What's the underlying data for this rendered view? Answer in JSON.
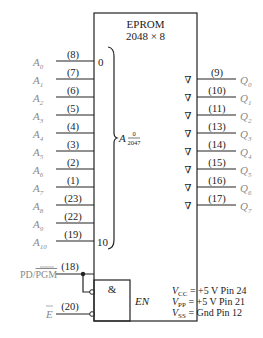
{
  "chip": {
    "title_line1": "EPROM",
    "title_line2": "2048 × 8",
    "address_range_start": "0",
    "address_range_end": "10",
    "address_label": "A",
    "address_num": "0",
    "address_den": "2047"
  },
  "address_inputs": [
    {
      "signal": "A",
      "sub": "0",
      "pin": "(8)"
    },
    {
      "signal": "A",
      "sub": "1",
      "pin": "(7)"
    },
    {
      "signal": "A",
      "sub": "2",
      "pin": "(6)"
    },
    {
      "signal": "A",
      "sub": "3",
      "pin": "(5)"
    },
    {
      "signal": "A",
      "sub": "4",
      "pin": "(4)"
    },
    {
      "signal": "A",
      "sub": "5",
      "pin": "(3)"
    },
    {
      "signal": "A",
      "sub": "6",
      "pin": "(2)"
    },
    {
      "signal": "A",
      "sub": "7",
      "pin": "(1)"
    },
    {
      "signal": "A",
      "sub": "8",
      "pin": "(23)"
    },
    {
      "signal": "A",
      "sub": "9",
      "pin": "(22)"
    },
    {
      "signal": "A",
      "sub": "10",
      "pin": "(19)"
    }
  ],
  "data_outputs": [
    {
      "signal": "Q",
      "sub": "0",
      "pin": "(9)",
      "symbol": "∇"
    },
    {
      "signal": "Q",
      "sub": "1",
      "pin": "(10)",
      "symbol": "∇"
    },
    {
      "signal": "Q",
      "sub": "2",
      "pin": "(11)",
      "symbol": "∇"
    },
    {
      "signal": "Q",
      "sub": "3",
      "pin": "(13)",
      "symbol": "∇"
    },
    {
      "signal": "Q",
      "sub": "4",
      "pin": "(14)",
      "symbol": "∇"
    },
    {
      "signal": "Q",
      "sub": "5",
      "pin": "(15)",
      "symbol": "∇"
    },
    {
      "signal": "Q",
      "sub": "6",
      "pin": "(16)",
      "symbol": "∇"
    },
    {
      "signal": "Q",
      "sub": "7",
      "pin": "(17)",
      "symbol": "∇"
    }
  ],
  "control": {
    "pd_pgm_label_pd": "PD/",
    "pd_pgm_label_pgm": "PGM",
    "pd_pgm_pin": "(18)",
    "e_label": "E",
    "e_pin": "(20)",
    "and_symbol": "&",
    "enable_label": "EN"
  },
  "power": [
    {
      "v": "V",
      "sub": "CC",
      "rest": "= +5 V  Pin 24"
    },
    {
      "v": "V",
      "sub": "PP",
      "rest": "= +5 V  Pin 21"
    },
    {
      "v": "V",
      "sub": "SS",
      "rest": "= Gnd   Pin 12"
    }
  ]
}
